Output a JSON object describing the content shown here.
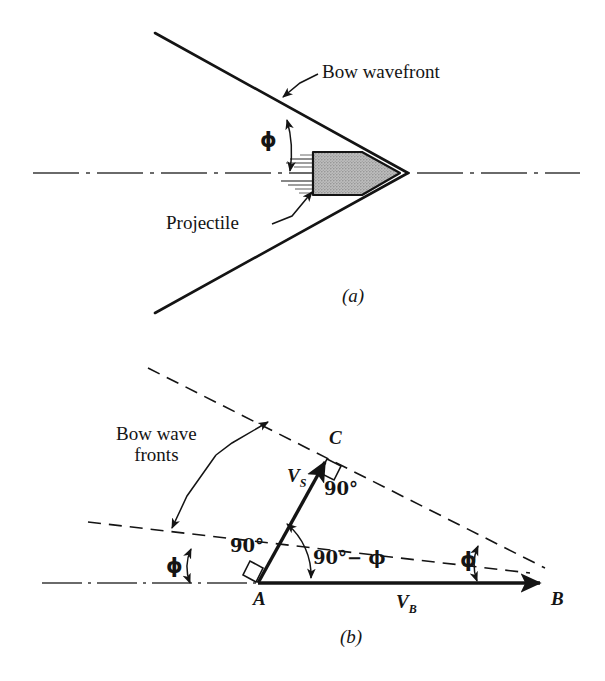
{
  "figure": {
    "background_color": "#ffffff",
    "ink_color": "#141414",
    "projectile_fill": "#b3b3b3"
  },
  "panel_a": {
    "tag": "(a)",
    "labels": {
      "bow_wavefront": "Bow wavefront",
      "projectile": "Projectile",
      "phi": "ϕ"
    },
    "geometry": {
      "apex": [
        408,
        173
      ],
      "upper_wavefront_start": [
        155,
        33
      ],
      "lower_wavefront_end": [
        155,
        313
      ],
      "axis_y": 173,
      "axis_x_start": 33,
      "axis_x_end": 580,
      "projectile_tail_x": 313,
      "projectile_nose_x": 400,
      "half_angle_deg": 39
    }
  },
  "panel_b": {
    "tag": "(b)",
    "labels": {
      "bow_wave_fronts_line1": "Bow wave",
      "bow_wave_fronts_line2": "fronts",
      "point_a": "A",
      "point_b": "B",
      "point_c": "C",
      "v_s_symbol": "V",
      "v_s_sub": "S",
      "v_b_symbol": "V",
      "v_b_sub": "B",
      "angle_90_at_c": "90°",
      "angle_90_at_a": "90°",
      "angle_90_minus_phi": "90°− ϕ",
      "phi_left": "ϕ",
      "phi_right": "ϕ"
    },
    "geometry": {
      "point_a": [
        258,
        583
      ],
      "point_b": [
        545,
        583
      ],
      "point_c": [
        327,
        458
      ],
      "baseline_y": 583,
      "axis_x_start": 42,
      "front_lower_start": [
        88,
        522
      ],
      "front_lower_end": [
        528,
        572
      ],
      "front_upper_start": [
        148,
        368
      ],
      "front_upper_end": [
        545,
        568
      ],
      "phi_deg": 23
    }
  }
}
